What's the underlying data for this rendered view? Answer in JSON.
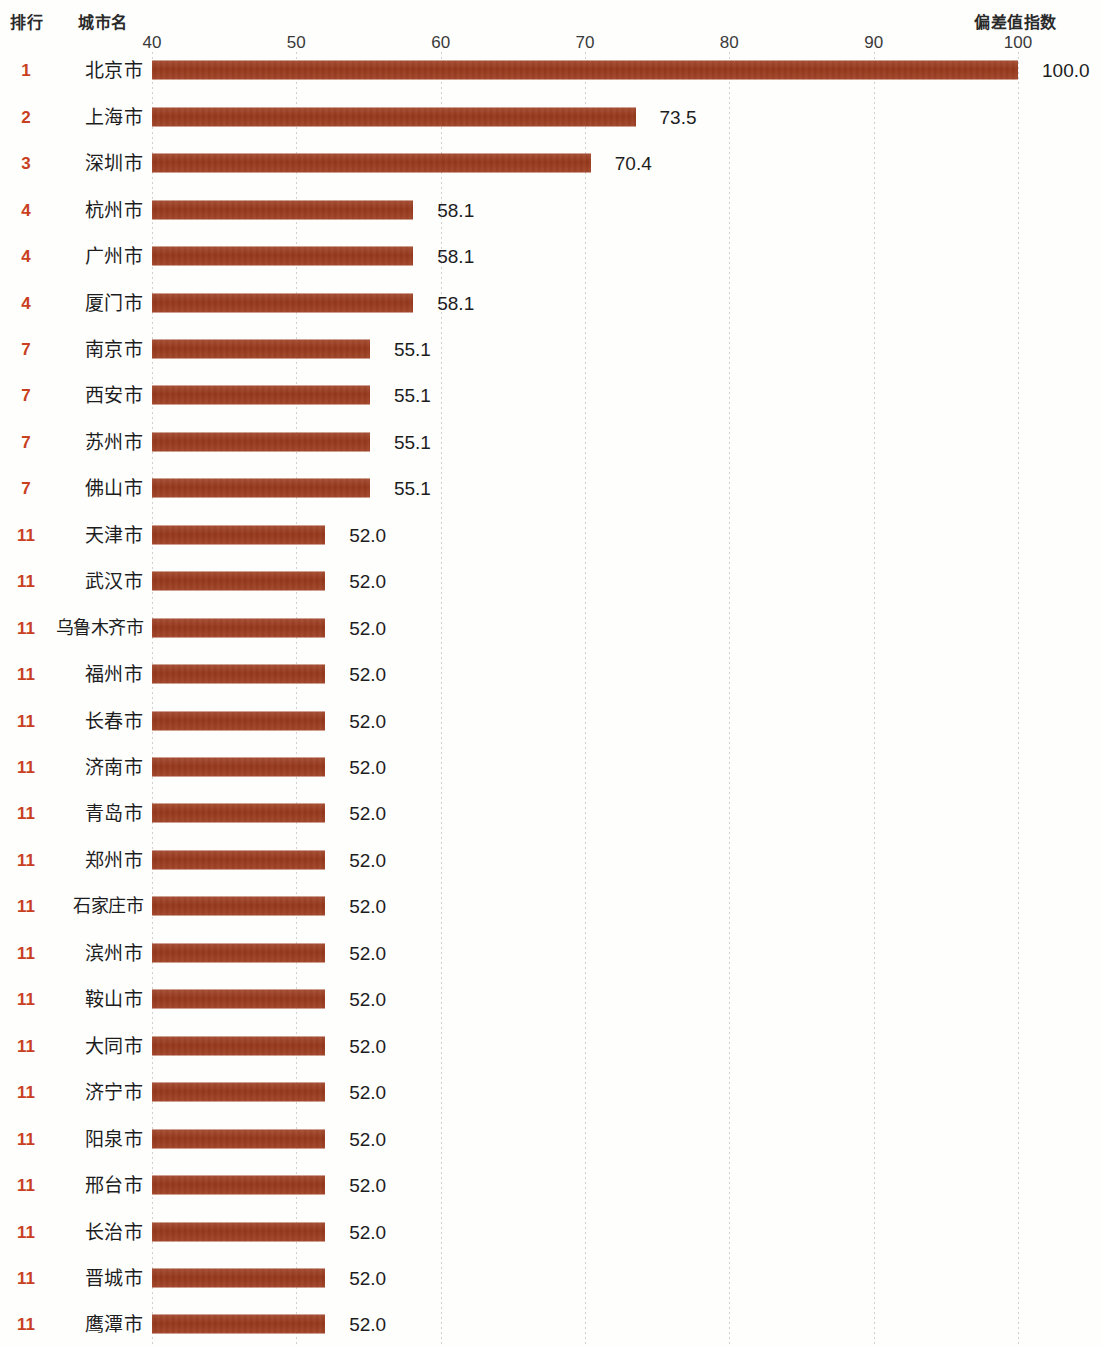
{
  "header": {
    "rank_label": "排行",
    "city_label": "城市名",
    "metric_label": "偏差值指数"
  },
  "colors": {
    "bar": "#9d3a1c",
    "rank_text": "#c8401f",
    "gridline": "#c8c8c8",
    "background": "#fefefd",
    "text": "#1d1d1d"
  },
  "chart_data": {
    "type": "bar",
    "orientation": "horizontal",
    "title": "偏差值指数",
    "xlabel": "偏差值指数",
    "ylabel": "城市名",
    "xlim": [
      40,
      100
    ],
    "grid": true,
    "legend": "none",
    "tick_labels": [
      "40",
      "50",
      "60",
      "70",
      "80",
      "90",
      "100"
    ],
    "ticks": [
      40,
      50,
      60,
      70,
      80,
      90,
      100
    ],
    "categories": [
      "北京市",
      "上海市",
      "深圳市",
      "杭州市",
      "广州市",
      "厦门市",
      "南京市",
      "西安市",
      "苏州市",
      "佛山市",
      "天津市",
      "武汉市",
      "乌鲁木齐市",
      "福州市",
      "长春市",
      "济南市",
      "青岛市",
      "郑州市",
      "石家庄市",
      "滨州市",
      "鞍山市",
      "大同市",
      "济宁市",
      "阳泉市",
      "邢台市",
      "长治市",
      "晋城市",
      "鹰潭市"
    ],
    "values": [
      100.0,
      73.5,
      70.4,
      58.1,
      58.1,
      58.1,
      55.1,
      55.1,
      55.1,
      55.1,
      52.0,
      52.0,
      52.0,
      52.0,
      52.0,
      52.0,
      52.0,
      52.0,
      52.0,
      52.0,
      52.0,
      52.0,
      52.0,
      52.0,
      52.0,
      52.0,
      52.0,
      52.0
    ],
    "ranks": [
      1,
      2,
      3,
      4,
      4,
      4,
      7,
      7,
      7,
      7,
      11,
      11,
      11,
      11,
      11,
      11,
      11,
      11,
      11,
      11,
      11,
      11,
      11,
      11,
      11,
      11,
      11,
      11
    ]
  },
  "rows": [
    {
      "rank": "1",
      "city": "北京市",
      "value": "100.0",
      "v": 100.0
    },
    {
      "rank": "2",
      "city": "上海市",
      "value": "73.5",
      "v": 73.5
    },
    {
      "rank": "3",
      "city": "深圳市",
      "value": "70.4",
      "v": 70.4
    },
    {
      "rank": "4",
      "city": "杭州市",
      "value": "58.1",
      "v": 58.1
    },
    {
      "rank": "4",
      "city": "广州市",
      "value": "58.1",
      "v": 58.1
    },
    {
      "rank": "4",
      "city": "厦门市",
      "value": "58.1",
      "v": 58.1
    },
    {
      "rank": "7",
      "city": "南京市",
      "value": "55.1",
      "v": 55.1
    },
    {
      "rank": "7",
      "city": "西安市",
      "value": "55.1",
      "v": 55.1
    },
    {
      "rank": "7",
      "city": "苏州市",
      "value": "55.1",
      "v": 55.1
    },
    {
      "rank": "7",
      "city": "佛山市",
      "value": "55.1",
      "v": 55.1
    },
    {
      "rank": "11",
      "city": "天津市",
      "value": "52.0",
      "v": 52.0
    },
    {
      "rank": "11",
      "city": "武汉市",
      "value": "52.0",
      "v": 52.0
    },
    {
      "rank": "11",
      "city": "乌鲁木齐市",
      "value": "52.0",
      "v": 52.0
    },
    {
      "rank": "11",
      "city": "福州市",
      "value": "52.0",
      "v": 52.0
    },
    {
      "rank": "11",
      "city": "长春市",
      "value": "52.0",
      "v": 52.0
    },
    {
      "rank": "11",
      "city": "济南市",
      "value": "52.0",
      "v": 52.0
    },
    {
      "rank": "11",
      "city": "青岛市",
      "value": "52.0",
      "v": 52.0
    },
    {
      "rank": "11",
      "city": "郑州市",
      "value": "52.0",
      "v": 52.0
    },
    {
      "rank": "11",
      "city": "石家庄市",
      "value": "52.0",
      "v": 52.0
    },
    {
      "rank": "11",
      "city": "滨州市",
      "value": "52.0",
      "v": 52.0
    },
    {
      "rank": "11",
      "city": "鞍山市",
      "value": "52.0",
      "v": 52.0
    },
    {
      "rank": "11",
      "city": "大同市",
      "value": "52.0",
      "v": 52.0
    },
    {
      "rank": "11",
      "city": "济宁市",
      "value": "52.0",
      "v": 52.0
    },
    {
      "rank": "11",
      "city": "阳泉市",
      "value": "52.0",
      "v": 52.0
    },
    {
      "rank": "11",
      "city": "邢台市",
      "value": "52.0",
      "v": 52.0
    },
    {
      "rank": "11",
      "city": "长治市",
      "value": "52.0",
      "v": 52.0
    },
    {
      "rank": "11",
      "city": "晋城市",
      "value": "52.0",
      "v": 52.0
    },
    {
      "rank": "11",
      "city": "鹰潭市",
      "value": "52.0",
      "v": 52.0
    }
  ]
}
